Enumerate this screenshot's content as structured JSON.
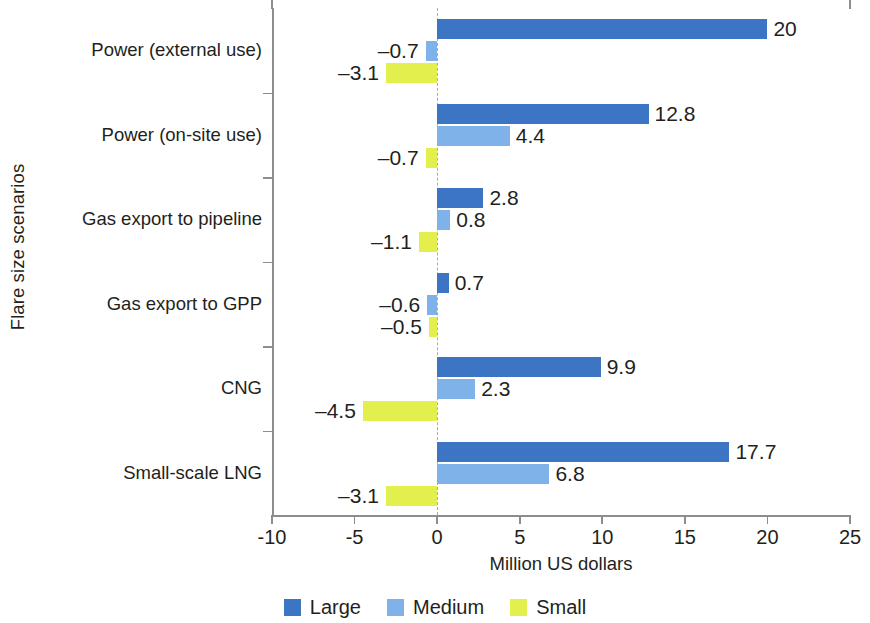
{
  "chart_data": {
    "type": "bar",
    "orientation": "horizontal",
    "title": "",
    "xlabel": "Million US dollars",
    "ylabel": "Flare size scenarios",
    "xlim": [
      -10,
      25
    ],
    "xticks": [
      -10,
      -5,
      0,
      5,
      10,
      15,
      20,
      25
    ],
    "xtick_labels": [
      "-10",
      "-5",
      "0",
      "5",
      "10",
      "15",
      "20",
      "25"
    ],
    "grid": false,
    "legend_position": "bottom",
    "categories": [
      "Power (external use)",
      "Power (on-site use)",
      "Gas export to pipeline",
      "Gas export to GPP",
      "CNG",
      "Small-scale LNG"
    ],
    "series": [
      {
        "name": "Large",
        "color": "#3b75c4",
        "values": [
          20,
          12.8,
          2.8,
          0.7,
          9.9,
          17.7
        ],
        "labels": [
          "20",
          "12.8",
          "2.8",
          "0.7",
          "9.9",
          "17.7"
        ]
      },
      {
        "name": "Medium",
        "color": "#7fb2e8",
        "values": [
          -0.7,
          4.4,
          0.8,
          -0.6,
          2.3,
          6.8
        ],
        "labels": [
          "–0.7",
          "4.4",
          "0.8",
          "–0.6",
          "2.3",
          "6.8"
        ]
      },
      {
        "name": "Small",
        "color": "#e3ef4c",
        "values": [
          -3.1,
          -0.7,
          -1.1,
          -0.5,
          -4.5,
          -3.1
        ],
        "labels": [
          "–3.1",
          "–0.7",
          "–1.1",
          "–0.5",
          "–4.5",
          "–3.1"
        ]
      }
    ]
  },
  "legend": {
    "items": [
      {
        "label": "Large",
        "color": "#3b75c4"
      },
      {
        "label": "Medium",
        "color": "#7fb2e8"
      },
      {
        "label": "Small",
        "color": "#e3ef4c"
      }
    ]
  }
}
